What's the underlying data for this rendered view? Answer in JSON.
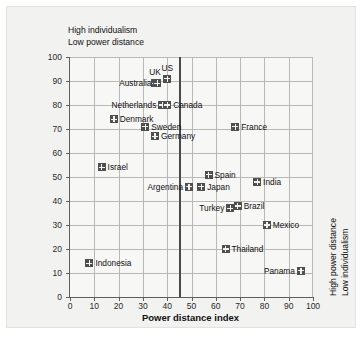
{
  "chart_data": {
    "type": "scatter",
    "title": "",
    "xlabel": "Power distance index",
    "ylabel": "Individualism index",
    "xlim": [
      0,
      100
    ],
    "ylim": [
      0,
      100
    ],
    "xticks": [
      0,
      10,
      20,
      30,
      40,
      50,
      60,
      70,
      80,
      90,
      100
    ],
    "yticks": [
      0,
      10,
      20,
      30,
      40,
      50,
      60,
      70,
      80,
      90,
      100
    ],
    "grid": true,
    "legend": "none",
    "reference_line_x": 45,
    "annotations": {
      "top_left_line1": "High individualism",
      "top_left_line2": "Low power distance",
      "right_line1": "High power distance",
      "right_line2": "Low individualism"
    },
    "marker_color": "#4f4f4f",
    "points": [
      {
        "label": "US",
        "x": 40,
        "y": 91,
        "pos": "t"
      },
      {
        "label": "UK",
        "x": 35,
        "y": 89,
        "pos": "t"
      },
      {
        "label": "Australia",
        "x": 36,
        "y": 89,
        "pos": "l"
      },
      {
        "label": "Netherlands",
        "x": 38,
        "y": 80,
        "pos": "l"
      },
      {
        "label": "Canada",
        "x": 40,
        "y": 80,
        "pos": "r"
      },
      {
        "label": "Denmark",
        "x": 18,
        "y": 74,
        "pos": "r"
      },
      {
        "label": "Sweden",
        "x": 31,
        "y": 71,
        "pos": "r"
      },
      {
        "label": "France",
        "x": 68,
        "y": 71,
        "pos": "r"
      },
      {
        "label": "Germany",
        "x": 35,
        "y": 67,
        "pos": "r"
      },
      {
        "label": "Israel",
        "x": 13,
        "y": 54,
        "pos": "r"
      },
      {
        "label": "Spain",
        "x": 57,
        "y": 51,
        "pos": "r"
      },
      {
        "label": "India",
        "x": 77,
        "y": 48,
        "pos": "r"
      },
      {
        "label": "Japan",
        "x": 54,
        "y": 46,
        "pos": "r"
      },
      {
        "label": "Argentina",
        "x": 49,
        "y": 46,
        "pos": "l"
      },
      {
        "label": "Brazil",
        "x": 69,
        "y": 38,
        "pos": "r"
      },
      {
        "label": "Turkey",
        "x": 66,
        "y": 37,
        "pos": "l"
      },
      {
        "label": "Mexico",
        "x": 81,
        "y": 30,
        "pos": "r"
      },
      {
        "label": "Thailand",
        "x": 64,
        "y": 20,
        "pos": "r"
      },
      {
        "label": "Indonesia",
        "x": 8,
        "y": 14,
        "pos": "r"
      },
      {
        "label": "Panama",
        "x": 95,
        "y": 11,
        "pos": "l"
      }
    ]
  }
}
